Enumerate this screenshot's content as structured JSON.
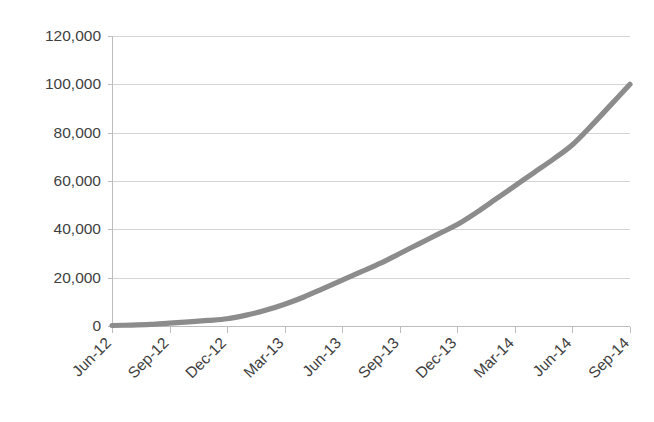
{
  "chart_data": {
    "type": "line",
    "title": "",
    "subtitle": "",
    "xlabel": "",
    "ylabel": "",
    "grid": true,
    "legend": false,
    "legend_position": "none",
    "series_color": "#8C8C8C",
    "axis_color": "#BDBDBD",
    "grid_color": "#D4D4D4",
    "background_color": "#FFFFFF",
    "xlim": [
      "Jun-12",
      "Sep-14"
    ],
    "ylim": [
      0,
      120000
    ],
    "y_tick_step": 20000,
    "y_tick_labels": [
      "0",
      "20,000",
      "40,000",
      "60,000",
      "80,000",
      "100,000",
      "120,000"
    ],
    "y_tick_values": [
      0,
      20000,
      40000,
      60000,
      80000,
      100000,
      120000
    ],
    "x_tick_labels": [
      "Jun-12",
      "Sep-12",
      "Dec-12",
      "Mar-13",
      "Jun-13",
      "Sep-13",
      "Dec-13",
      "Mar-14",
      "Jun-14",
      "Sep-14"
    ],
    "x_label_rotation_deg": 45,
    "categories": [
      "Jun-12",
      "Sep-12",
      "Dec-12",
      "Mar-13",
      "Jun-13",
      "Sep-13",
      "Dec-13",
      "Mar-14",
      "Jun-14",
      "Sep-14"
    ],
    "series": [
      {
        "name": "Cumulative total",
        "values": [
          200,
          1200,
          3000,
          9000,
          19000,
          30000,
          42000,
          58000,
          75000,
          100000
        ]
      }
    ],
    "points_monthly": [
      {
        "x": "Jun-12",
        "y": 200
      },
      {
        "x": "Jul-12",
        "y": 400
      },
      {
        "x": "Aug-12",
        "y": 700
      },
      {
        "x": "Sep-12",
        "y": 1200
      },
      {
        "x": "Oct-12",
        "y": 1700
      },
      {
        "x": "Nov-12",
        "y": 2300
      },
      {
        "x": "Dec-12",
        "y": 3000
      },
      {
        "x": "Jan-13",
        "y": 4500
      },
      {
        "x": "Feb-13",
        "y": 6500
      },
      {
        "x": "Mar-13",
        "y": 9000
      },
      {
        "x": "Apr-13",
        "y": 12000
      },
      {
        "x": "May-13",
        "y": 15500
      },
      {
        "x": "Jun-13",
        "y": 19000
      },
      {
        "x": "Jul-13",
        "y": 22500
      },
      {
        "x": "Aug-13",
        "y": 26000
      },
      {
        "x": "Sep-13",
        "y": 30000
      },
      {
        "x": "Oct-13",
        "y": 34000
      },
      {
        "x": "Nov-13",
        "y": 38000
      },
      {
        "x": "Dec-13",
        "y": 42000
      },
      {
        "x": "Jan-14",
        "y": 47000
      },
      {
        "x": "Feb-14",
        "y": 52500
      },
      {
        "x": "Mar-14",
        "y": 58000
      },
      {
        "x": "Apr-14",
        "y": 63500
      },
      {
        "x": "May-14",
        "y": 69000
      },
      {
        "x": "Jun-14",
        "y": 75000
      },
      {
        "x": "Jul-14",
        "y": 83000
      },
      {
        "x": "Aug-14",
        "y": 91500
      },
      {
        "x": "Sep-14",
        "y": 100000
      }
    ]
  },
  "plot_geometry": {
    "left": 112,
    "right": 630,
    "top": 36,
    "bottom": 326
  }
}
